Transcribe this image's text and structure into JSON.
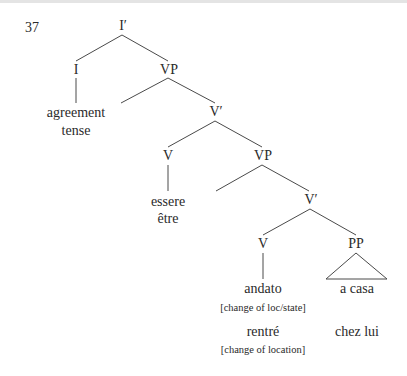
{
  "example_number": "37",
  "nodes": {
    "i_bar": "I′",
    "i": "I",
    "vp1": "VP",
    "i_content_1": "agreement",
    "i_content_2": "tense",
    "v_bar1": "V′",
    "v1": "V",
    "vp2": "VP",
    "v1_italian": "essere",
    "v1_french": "être",
    "v_bar2": "V′",
    "v2": "V",
    "pp": "PP",
    "v2_italian": "andato",
    "v2_italian_note": "[change of loc/state]",
    "pp_italian": "a casa",
    "v2_french": "rentré",
    "v2_french_note": "[change of location]",
    "pp_french": "chez lui"
  },
  "colors": {
    "line": "#4a4a4a",
    "text": "#2a2a2a"
  }
}
